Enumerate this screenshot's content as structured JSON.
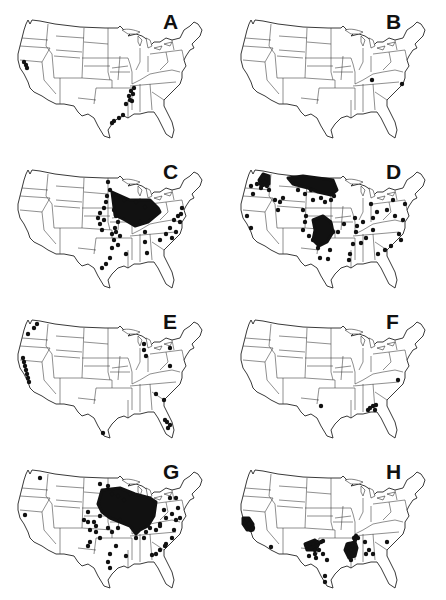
{
  "figure": {
    "panels": [
      {
        "label": "A",
        "col": 0,
        "row": 0,
        "dots": [
          [
            24,
            62
          ],
          [
            26,
            65
          ],
          [
            27,
            68
          ],
          [
            131,
            91
          ],
          [
            134,
            88
          ],
          [
            133,
            94
          ],
          [
            129,
            96
          ],
          [
            130,
            100
          ],
          [
            132,
            101
          ],
          [
            126,
            104
          ],
          [
            123,
            115
          ],
          [
            119,
            118
          ],
          [
            114,
            121
          ],
          [
            112,
            123
          ]
        ]
      },
      {
        "label": "B",
        "col": 1,
        "row": 0,
        "dots": [
          [
            149,
            80
          ],
          [
            179,
            84
          ]
        ]
      },
      {
        "label": "C",
        "col": 0,
        "row": 1,
        "dots": [
          [
            108,
            32
          ],
          [
            110,
            40
          ],
          [
            107,
            46
          ],
          [
            106,
            52
          ],
          [
            104,
            58
          ],
          [
            100,
            63
          ],
          [
            98,
            68
          ],
          [
            104,
            70
          ],
          [
            102,
            80
          ],
          [
            114,
            60
          ],
          [
            116,
            66
          ],
          [
            118,
            72
          ],
          [
            115,
            78
          ],
          [
            116,
            82
          ],
          [
            114,
            90
          ],
          [
            112,
            98
          ],
          [
            118,
            95
          ],
          [
            110,
            108
          ],
          [
            106,
            114
          ],
          [
            102,
            118
          ],
          [
            124,
            50
          ],
          [
            136,
            52
          ],
          [
            145,
            57
          ],
          [
            140,
            72
          ],
          [
            145,
            82
          ],
          [
            145,
            92
          ],
          [
            160,
            90
          ],
          [
            166,
            84
          ],
          [
            170,
            78
          ],
          [
            174,
            70
          ],
          [
            178,
            66
          ],
          [
            181,
            64
          ],
          [
            180,
            72
          ],
          [
            182,
            58
          ],
          [
            176,
            82
          ],
          [
            172,
            88
          ],
          [
            100,
            74
          ],
          [
            112,
            84
          ],
          [
            120,
            86
          ],
          [
            126,
            104
          ],
          [
            147,
            103
          ]
        ],
        "clusters": [
          [
            [
              112,
              42
            ],
            [
              130,
              50
            ],
            [
              150,
              50
            ],
            [
              158,
              58
            ],
            [
              160,
              62
            ],
            [
              148,
              72
            ],
            [
              135,
              76
            ],
            [
              125,
              70
            ],
            [
              115,
              65
            ]
          ]
        ]
      },
      {
        "label": "D",
        "col": 1,
        "row": 1,
        "dots": [
          [
            28,
            36
          ],
          [
            34,
            34
          ],
          [
            38,
            38
          ],
          [
            40,
            28
          ],
          [
            42,
            32
          ],
          [
            44,
            36
          ],
          [
            46,
            40
          ],
          [
            30,
            44
          ],
          [
            52,
            50
          ],
          [
            57,
            52
          ],
          [
            60,
            48
          ],
          [
            55,
            60
          ],
          [
            24,
            66
          ],
          [
            28,
            78
          ],
          [
            70,
            30
          ],
          [
            73,
            34
          ],
          [
            75,
            40
          ],
          [
            82,
            44
          ],
          [
            88,
            40
          ],
          [
            90,
            50
          ],
          [
            98,
            48
          ],
          [
            102,
            52
          ],
          [
            108,
            50
          ],
          [
            111,
            46
          ],
          [
            80,
            60
          ],
          [
            83,
            66
          ],
          [
            82,
            72
          ],
          [
            80,
            80
          ],
          [
            86,
            86
          ],
          [
            90,
            90
          ],
          [
            95,
            98
          ],
          [
            97,
            108
          ],
          [
            105,
            109
          ],
          [
            107,
            100
          ],
          [
            110,
            82
          ],
          [
            115,
            82
          ],
          [
            121,
            74
          ],
          [
            132,
            68
          ],
          [
            134,
            76
          ],
          [
            133,
            82
          ],
          [
            140,
            72
          ],
          [
            150,
            68
          ],
          [
            150,
            80
          ],
          [
            148,
            54
          ],
          [
            154,
            62
          ],
          [
            170,
            50
          ],
          [
            164,
            60
          ],
          [
            172,
            66
          ],
          [
            180,
            70
          ],
          [
            143,
            88
          ],
          [
            138,
            93
          ],
          [
            130,
            94
          ],
          [
            127,
            104
          ],
          [
            126,
            110
          ],
          [
            155,
            104
          ],
          [
            162,
            100
          ],
          [
            168,
            96
          ],
          [
            176,
            84
          ],
          [
            182,
            54
          ],
          [
            178,
            90
          ]
        ],
        "clusters": [
          [
            [
              65,
              28
            ],
            [
              80,
              26
            ],
            [
              95,
              28
            ],
            [
              110,
              30
            ],
            [
              114,
              40
            ],
            [
              108,
              45
            ],
            [
              95,
              42
            ],
            [
              85,
              38
            ],
            [
              70,
              34
            ]
          ],
          [
            [
              90,
              70
            ],
            [
              100,
              66
            ],
            [
              108,
              72
            ],
            [
              110,
              82
            ],
            [
              104,
              92
            ],
            [
              96,
              96
            ],
            [
              90,
              90
            ],
            [
              92,
              80
            ]
          ],
          [
            [
              40,
              24
            ],
            [
              46,
              26
            ],
            [
              46,
              34
            ],
            [
              38,
              36
            ],
            [
              36,
              30
            ]
          ]
        ]
      },
      {
        "label": "E",
        "col": 0,
        "row": 2,
        "dots": [
          [
            37,
            24
          ],
          [
            34,
            28
          ],
          [
            28,
            34
          ],
          [
            23,
            58
          ],
          [
            24,
            62
          ],
          [
            25,
            66
          ],
          [
            26,
            70
          ],
          [
            27,
            74
          ],
          [
            28,
            78
          ],
          [
            29,
            82
          ],
          [
            144,
            44
          ],
          [
            144,
            50
          ],
          [
            146,
            56
          ],
          [
            170,
            48
          ],
          [
            170,
            66
          ],
          [
            164,
            100
          ],
          [
            156,
            94
          ],
          [
            165,
            120
          ],
          [
            167,
            122
          ],
          [
            170,
            125
          ],
          [
            168,
            128
          ],
          [
            103,
            133
          ]
        ]
      },
      {
        "label": "F",
        "col": 1,
        "row": 2,
        "dots": [
          [
            98,
            106
          ],
          [
            147,
            108
          ],
          [
            150,
            106
          ],
          [
            153,
            105
          ],
          [
            152,
            110
          ],
          [
            145,
            110
          ],
          [
            175,
            80
          ]
        ]
      },
      {
        "label": "G",
        "col": 0,
        "row": 3,
        "dots": [
          [
            40,
            28
          ],
          [
            25,
            65
          ],
          [
            100,
            34
          ],
          [
            108,
            36
          ],
          [
            112,
            44
          ],
          [
            118,
            46
          ],
          [
            124,
            50
          ],
          [
            130,
            44
          ],
          [
            88,
            62
          ],
          [
            84,
            70
          ],
          [
            88,
            72
          ],
          [
            94,
            72
          ],
          [
            96,
            76
          ],
          [
            100,
            66
          ],
          [
            90,
            80
          ],
          [
            96,
            82
          ],
          [
            100,
            88
          ],
          [
            108,
            78
          ],
          [
            112,
            82
          ],
          [
            118,
            78
          ],
          [
            120,
            70
          ],
          [
            90,
            92
          ],
          [
            88,
            96
          ],
          [
            116,
            96
          ],
          [
            110,
            104
          ],
          [
            108,
            112
          ],
          [
            110,
            118
          ],
          [
            126,
            106
          ],
          [
            136,
            88
          ],
          [
            144,
            88
          ],
          [
            146,
            82
          ],
          [
            150,
            78
          ],
          [
            156,
            80
          ],
          [
            160,
            74
          ],
          [
            164,
            60
          ],
          [
            166,
            68
          ],
          [
            170,
            48
          ],
          [
            176,
            48
          ],
          [
            172,
            64
          ],
          [
            176,
            70
          ],
          [
            180,
            68
          ],
          [
            178,
            58
          ],
          [
            174,
            80
          ],
          [
            172,
            88
          ],
          [
            165,
            96
          ],
          [
            160,
            100
          ],
          [
            156,
            104
          ],
          [
            152,
            105
          ],
          [
            166,
            94
          ],
          [
            160,
            76
          ]
        ],
        "clusters": [
          [
            [
              102,
              40
            ],
            [
              120,
              38
            ],
            [
              135,
              44
            ],
            [
              150,
              48
            ],
            [
              156,
              52
            ],
            [
              154,
              66
            ],
            [
              148,
              76
            ],
            [
              140,
              80
            ],
            [
              136,
              84
            ],
            [
              130,
              76
            ],
            [
              120,
              72
            ],
            [
              110,
              68
            ],
            [
              102,
              62
            ],
            [
              98,
              54
            ]
          ]
        ]
      },
      {
        "label": "H",
        "col": 1,
        "row": 3,
        "dots": [
          [
            22,
            72
          ],
          [
            24,
            70
          ],
          [
            26,
            76
          ],
          [
            28,
            80
          ],
          [
            26,
            74
          ],
          [
            30,
            78
          ],
          [
            48,
            97
          ],
          [
            84,
            96
          ],
          [
            87,
            94
          ],
          [
            90,
            94
          ],
          [
            94,
            92
          ],
          [
            98,
            92
          ],
          [
            100,
            91
          ],
          [
            88,
            98
          ],
          [
            92,
            100
          ],
          [
            96,
            100
          ],
          [
            94,
            96
          ],
          [
            92,
            104
          ],
          [
            86,
            106
          ],
          [
            100,
            104
          ],
          [
            93,
            108
          ],
          [
            104,
            110
          ],
          [
            102,
            126
          ],
          [
            102,
            132
          ],
          [
            131,
            88
          ],
          [
            133,
            86
          ],
          [
            135,
            88
          ],
          [
            126,
            94
          ],
          [
            126,
            98
          ],
          [
            128,
            100
          ],
          [
            126,
            104
          ],
          [
            127,
            107
          ],
          [
            130,
            96
          ],
          [
            131,
            102
          ],
          [
            128,
            110
          ],
          [
            142,
            92
          ],
          [
            146,
            100
          ],
          [
            143,
            104
          ],
          [
            150,
            104
          ],
          [
            164,
            92
          ],
          [
            132,
            90
          ]
        ],
        "clusters": [
          [
            [
              20,
              68
            ],
            [
              26,
              68
            ],
            [
              30,
              74
            ],
            [
              30,
              80
            ],
            [
              24,
              80
            ],
            [
              20,
              74
            ]
          ],
          [
            [
              82,
              94
            ],
            [
              92,
              90
            ],
            [
              96,
              94
            ],
            [
              92,
              100
            ],
            [
              84,
              100
            ]
          ],
          [
            [
              124,
              94
            ],
            [
              132,
              92
            ],
            [
              134,
              98
            ],
            [
              132,
              106
            ],
            [
              126,
              108
            ],
            [
              122,
              100
            ]
          ]
        ]
      }
    ]
  }
}
